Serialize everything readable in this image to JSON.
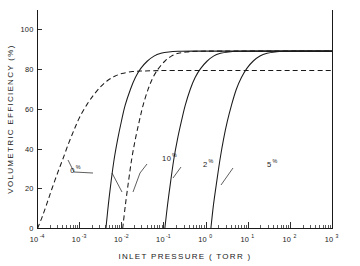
{
  "chart_data": {
    "type": "line",
    "title": "",
    "xlabel": "INLET PRESSURE  ( TORR )",
    "ylabel": "VOLUMETRIC  EFFICIENCY  (%)",
    "xscale": "log",
    "xlim": [
      0.0001,
      1000
    ],
    "ylim": [
      0,
      110
    ],
    "x_tick_labels": [
      "10",
      "10",
      "10",
      "10",
      "10",
      "10",
      "10",
      "10"
    ],
    "x_tick_exponents": [
      "-4",
      "-3",
      "-2",
      "-1",
      "0",
      "1",
      "2",
      "3"
    ],
    "x_tick_values": [
      0.0001,
      0.001,
      0.01,
      0.1,
      1,
      10,
      100,
      1000
    ],
    "y_ticks": [
      0,
      20,
      40,
      60,
      80,
      100
    ],
    "y_tick_labels": [
      "0",
      "20",
      "40",
      "60",
      "80",
      "100"
    ],
    "grid": false,
    "legend": "inline-annotations",
    "series": [
      {
        "name": "0 %",
        "label": "0",
        "label_suffix": "%",
        "style": "dashed",
        "plateau": 79.5,
        "onset_pressure": 0.0001,
        "points": [
          [
            0.0001,
            0
          ],
          [
            0.00013,
            6
          ],
          [
            0.00017,
            13
          ],
          [
            0.00022,
            20
          ],
          [
            0.0003,
            28
          ],
          [
            0.0004,
            35
          ],
          [
            0.00055,
            43
          ],
          [
            0.00075,
            50
          ],
          [
            0.001,
            56
          ],
          [
            0.0015,
            62.5
          ],
          [
            0.0022,
            67.5
          ],
          [
            0.0032,
            71.5
          ],
          [
            0.0046,
            74.5
          ],
          [
            0.0068,
            76.6
          ],
          [
            0.01,
            78.0
          ],
          [
            0.018,
            79.0
          ],
          [
            0.032,
            79.3
          ],
          [
            0.1,
            79.5
          ],
          [
            1,
            79.5
          ],
          [
            10,
            79.5
          ],
          [
            100,
            79.5
          ],
          [
            1000,
            79.5
          ]
        ]
      },
      {
        "name": "curve-a",
        "label": "",
        "label_suffix": "",
        "style": "solid",
        "plateau": 89.3,
        "onset_pressure": 0.0042,
        "points": [
          [
            0.0042,
            0
          ],
          [
            0.0048,
            12
          ],
          [
            0.0056,
            24
          ],
          [
            0.0066,
            35
          ],
          [
            0.008,
            45
          ],
          [
            0.0098,
            54
          ],
          [
            0.012,
            62
          ],
          [
            0.016,
            70
          ],
          [
            0.021,
            76
          ],
          [
            0.028,
            80.5
          ],
          [
            0.04,
            84.2
          ],
          [
            0.058,
            86.8
          ],
          [
            0.085,
            88.2
          ],
          [
            0.13,
            88.9
          ],
          [
            0.22,
            89.2
          ],
          [
            0.5,
            89.3
          ],
          [
            2,
            89.3
          ],
          [
            10,
            89.3
          ],
          [
            100,
            89.3
          ],
          [
            1000,
            89.3
          ]
        ]
      },
      {
        "name": "10 %",
        "label": "10",
        "label_suffix": "%",
        "style": "dashed",
        "plateau": 89.3,
        "onset_pressure": 0.0105,
        "points": [
          [
            0.0105,
            0
          ],
          [
            0.0122,
            12
          ],
          [
            0.0145,
            24
          ],
          [
            0.0172,
            35
          ],
          [
            0.021,
            45
          ],
          [
            0.026,
            54
          ],
          [
            0.032,
            62
          ],
          [
            0.042,
            70
          ],
          [
            0.055,
            76
          ],
          [
            0.074,
            80.5
          ],
          [
            0.105,
            84.2
          ],
          [
            0.15,
            86.8
          ],
          [
            0.22,
            88.2
          ],
          [
            0.34,
            88.9
          ],
          [
            0.58,
            89.2
          ],
          [
            1.3,
            89.3
          ],
          [
            5,
            89.3
          ],
          [
            30,
            89.3
          ],
          [
            200,
            89.3
          ],
          [
            1000,
            89.3
          ]
        ]
      },
      {
        "name": "2 %",
        "label": "2",
        "label_suffix": "%",
        "style": "solid",
        "plateau": 89.3,
        "onset_pressure": 0.105,
        "points": [
          [
            0.105,
            0
          ],
          [
            0.122,
            12
          ],
          [
            0.145,
            24
          ],
          [
            0.172,
            35
          ],
          [
            0.21,
            45
          ],
          [
            0.26,
            54
          ],
          [
            0.32,
            62
          ],
          [
            0.42,
            70
          ],
          [
            0.55,
            76
          ],
          [
            0.74,
            80.5
          ],
          [
            1.05,
            84.2
          ],
          [
            1.5,
            86.8
          ],
          [
            2.2,
            88.2
          ],
          [
            3.4,
            88.9
          ],
          [
            5.8,
            89.2
          ],
          [
            13,
            89.3
          ],
          [
            50,
            89.3
          ],
          [
            300,
            89.3
          ],
          [
            1000,
            89.3
          ]
        ]
      },
      {
        "name": "5 %",
        "label": "5",
        "label_suffix": "%",
        "style": "solid",
        "plateau": 89.3,
        "onset_pressure": 1.3,
        "points": [
          [
            1.3,
            0
          ],
          [
            1.5,
            12
          ],
          [
            1.8,
            24
          ],
          [
            2.15,
            35
          ],
          [
            2.6,
            45
          ],
          [
            3.2,
            54
          ],
          [
            4.0,
            62
          ],
          [
            5.2,
            70
          ],
          [
            6.9,
            76
          ],
          [
            9.2,
            80.5
          ],
          [
            13,
            84.2
          ],
          [
            19,
            86.8
          ],
          [
            28,
            88.2
          ],
          [
            43,
            88.9
          ],
          [
            72,
            89.2
          ],
          [
            160,
            89.3
          ],
          [
            450,
            89.3
          ],
          [
            1000,
            89.3
          ]
        ]
      }
    ],
    "annotations": [
      {
        "text": "0",
        "suffix": "%",
        "x": 0.0006,
        "y": 28
      },
      {
        "text": "10",
        "suffix": "%",
        "x": 0.09,
        "y": 34
      },
      {
        "text": "2",
        "suffix": "%",
        "x": 0.85,
        "y": 31
      },
      {
        "text": "5",
        "suffix": "%",
        "x": 28,
        "y": 31
      }
    ]
  }
}
